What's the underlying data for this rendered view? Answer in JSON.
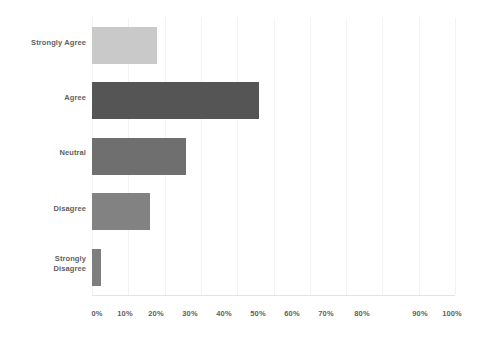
{
  "chart_data": {
    "type": "bar",
    "orientation": "horizontal",
    "title": "",
    "subtitle": "",
    "xlabel": "",
    "ylabel": "",
    "categories": [
      "Strongly Agree",
      "Agree",
      "Neutral",
      "Disagree",
      "Strongly Disagree"
    ],
    "values": [
      18,
      46,
      26,
      16,
      2.5
    ],
    "value_unit": "%",
    "xlim": [
      0,
      100
    ],
    "xticks": [
      0,
      10,
      20,
      30,
      40,
      50,
      60,
      70,
      80,
      90,
      100
    ],
    "xtick_labels": [
      "0%",
      "10%",
      "20%",
      "30%",
      "40%",
      "50%",
      "60%",
      "70%",
      "80%",
      "90%",
      "100%"
    ],
    "grid": "vertical-light",
    "legend": "none",
    "bar_colors": [
      "#c9c9c9",
      "#555555",
      "#6f6f6f",
      "#828282",
      "#7e7e7e"
    ],
    "series": [
      {
        "name": "Response share",
        "points": [
          {
            "category": "Strongly Agree",
            "value": 18,
            "color": "#c9c9c9"
          },
          {
            "category": "Agree",
            "value": 46,
            "color": "#555555"
          },
          {
            "category": "Neutral",
            "value": 26,
            "color": "#6f6f6f"
          },
          {
            "category": "Disagree",
            "value": 16,
            "color": "#828282"
          },
          {
            "category": "Strongly Disagree",
            "value": 2.5,
            "color": "#7e7e7e"
          }
        ]
      }
    ]
  },
  "axis": {
    "y_labels": [
      {
        "line1": "Strongly Agree",
        "line2": ""
      },
      {
        "line1": "Agree",
        "line2": ""
      },
      {
        "line1": "Neutral",
        "line2": ""
      },
      {
        "line1": "Disagree",
        "line2": ""
      },
      {
        "line1": "Strongly",
        "line2": "Disagree"
      }
    ],
    "x_labels": [
      "0%",
      "10%",
      "20%",
      "30%",
      "40%",
      "50%",
      "60%",
      "70%",
      "80%",
      "90%",
      "100%"
    ]
  },
  "style": {
    "background": "#ffffff",
    "gridline_color": "#f2f2f2",
    "axis_line_color": "#e3e3e3",
    "label_color": "#5f5f5f"
  }
}
